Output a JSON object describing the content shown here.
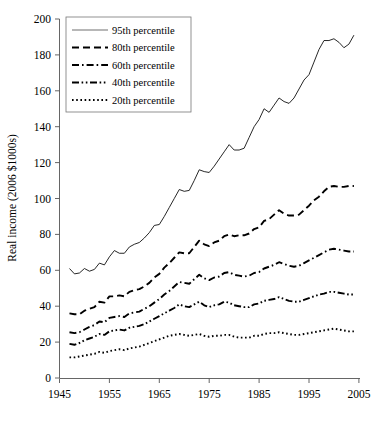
{
  "chart_data": {
    "type": "line",
    "title": "",
    "subtitle": "",
    "xlabel": "",
    "ylabel": "Real income (2006 $1000s)",
    "xlim": [
      1945,
      2005
    ],
    "ylim": [
      0,
      200
    ],
    "xticks": [
      1945,
      1955,
      1965,
      1975,
      1985,
      1995,
      2005
    ],
    "yticks": [
      0,
      20,
      40,
      60,
      80,
      100,
      120,
      140,
      160,
      180,
      200
    ],
    "grid": false,
    "legend_position": "top-left",
    "x": [
      1947,
      1948,
      1949,
      1950,
      1951,
      1952,
      1953,
      1954,
      1955,
      1956,
      1957,
      1958,
      1959,
      1960,
      1961,
      1962,
      1963,
      1964,
      1965,
      1966,
      1967,
      1968,
      1969,
      1970,
      1971,
      1972,
      1973,
      1974,
      1975,
      1976,
      1977,
      1978,
      1979,
      1980,
      1981,
      1982,
      1983,
      1984,
      1985,
      1986,
      1987,
      1988,
      1989,
      1990,
      1991,
      1992,
      1993,
      1994,
      1995,
      1996,
      1997,
      1998,
      1999,
      2000,
      2001,
      2002,
      2003,
      2004
    ],
    "series": [
      {
        "name": "95th percentile",
        "style": "solid",
        "values": [
          61,
          58,
          58.5,
          61,
          59.5,
          60.5,
          64,
          63,
          67.5,
          71,
          69.5,
          69.5,
          73,
          74.5,
          75.5,
          78,
          81,
          85,
          85.5,
          90,
          95,
          100,
          105,
          104,
          104.5,
          110,
          116,
          115,
          114.5,
          118,
          122,
          126,
          130,
          127,
          127,
          128,
          134,
          140,
          144,
          150,
          148,
          152,
          156,
          154,
          153,
          156,
          161,
          166,
          169,
          176,
          183,
          188,
          188,
          189,
          187,
          184,
          186,
          191
        ]
      },
      {
        "name": "80th percentile",
        "style": "dashed",
        "values": [
          36,
          35.5,
          35.5,
          37.5,
          38.5,
          39.5,
          42.5,
          42,
          45.5,
          45.5,
          46,
          45.5,
          48,
          49,
          49.5,
          51,
          53,
          56,
          58,
          61.5,
          64,
          67,
          70,
          69.5,
          69.5,
          73,
          76.5,
          74.5,
          73.5,
          75.5,
          76.5,
          79,
          80,
          79,
          79.5,
          79.5,
          80.5,
          83,
          84,
          87.5,
          88.5,
          91,
          93.5,
          91.5,
          90.5,
          90.5,
          91,
          93.5,
          96,
          99,
          101,
          104,
          106.5,
          107,
          106.5,
          106.5,
          107,
          107
        ]
      },
      {
        "name": "60th percentile",
        "style": "dashdot",
        "values": [
          25.5,
          25,
          25.5,
          27,
          28.5,
          29.5,
          31.5,
          31,
          33.5,
          34,
          34.5,
          34,
          36,
          36.5,
          37,
          38.5,
          40,
          42,
          44,
          46.5,
          48.5,
          51,
          53.5,
          53,
          52.5,
          55,
          57.5,
          55.5,
          54.5,
          56,
          56.5,
          58.5,
          59,
          57.5,
          57,
          56.5,
          57,
          58.5,
          59,
          61,
          62,
          63,
          64.5,
          63.5,
          62.5,
          62,
          62.5,
          64,
          65.5,
          67,
          68.5,
          70,
          71.5,
          72,
          71.5,
          71,
          70.5,
          70.5
        ]
      },
      {
        "name": "40th percentile",
        "style": "dashdotdot",
        "values": [
          19,
          18.5,
          19.5,
          21,
          22,
          23,
          24.5,
          24,
          26,
          26.5,
          27,
          26.5,
          28,
          28.5,
          29,
          30,
          31.5,
          33,
          34.5,
          36,
          37.5,
          39,
          41,
          40,
          39.5,
          41,
          42.5,
          40.5,
          39.5,
          40.5,
          41,
          42.5,
          42,
          40.5,
          40,
          39.5,
          39.5,
          41,
          41.5,
          43,
          43.5,
          44,
          45,
          44,
          43,
          42.5,
          42.5,
          43.5,
          44.5,
          45.5,
          46.5,
          47,
          48,
          48,
          47.5,
          47,
          46.5,
          46.5
        ]
      },
      {
        "name": "20th percentile",
        "style": "dotted",
        "values": [
          11.5,
          11.5,
          12,
          12.5,
          13,
          13.5,
          14.5,
          14,
          15,
          15.5,
          16,
          15.5,
          16.5,
          17,
          17.5,
          18.5,
          19.5,
          20.5,
          21.5,
          22.5,
          23.5,
          24,
          24.5,
          24,
          23.5,
          24,
          24.5,
          23.5,
          23,
          23.5,
          23.5,
          24,
          24,
          23,
          22.5,
          22.5,
          22.5,
          23.5,
          23.5,
          24.5,
          25,
          25,
          25.5,
          25,
          24.5,
          24,
          24,
          24.5,
          25,
          25.5,
          26,
          26.5,
          27,
          27.5,
          27,
          26.5,
          26,
          26
        ]
      }
    ],
    "colors": {
      "series_95th": "#555555",
      "series_other": "#000000",
      "axis": "#555555",
      "background": "#ffffff"
    }
  },
  "legend": {
    "items": [
      {
        "label": "95th percentile",
        "style": "solid"
      },
      {
        "label": "80th percentile",
        "style": "dashed"
      },
      {
        "label": "60th percentile",
        "style": "dashdot"
      },
      {
        "label": "40th percentile",
        "style": "dashdotdot"
      },
      {
        "label": "20th percentile",
        "style": "dotted"
      }
    ]
  },
  "axes": {
    "y_title": "Real income (2006 $1000s)",
    "y_tick_labels": [
      "200",
      "180",
      "160",
      "140",
      "120",
      "100",
      "80",
      "60",
      "40",
      "20",
      "0"
    ],
    "x_tick_labels": [
      "1945",
      "1955",
      "1965",
      "1975",
      "1985",
      "1995",
      "2005"
    ]
  }
}
